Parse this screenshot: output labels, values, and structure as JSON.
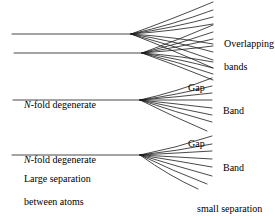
{
  "figure": {
    "type": "diagram"
  },
  "labels": {
    "overlapping_bands_line1": "Overlapping",
    "overlapping_bands_line2": "bands",
    "gap_upper": "Gap",
    "band_upper": "Band",
    "gap_lower": "Gap",
    "band_lower": "Band",
    "n_fold_upper_prefix": "N",
    "n_fold_upper_rest": "-fold degenerate",
    "n_fold_lower_prefix": "N",
    "n_fold_lower_rest": "-fold degenerate",
    "large_separation_line1": "Large separation",
    "large_separation_line2": "between atoms",
    "small_separation_line1": "small separation",
    "small_separation_line2": "between atoms"
  },
  "colors": {
    "stroke": "#1a1a1a",
    "background": "#ffffff",
    "text": "#000000"
  },
  "diagram_data": {
    "levels": [
      {
        "id": "level-1",
        "name": "top-level",
        "line_y": 34,
        "line_x_start": 12,
        "vertex_x": 131,
        "rays": 8,
        "spread_top": -32,
        "spread_bottom": 34,
        "right_x": 213
      },
      {
        "id": "level-2",
        "name": "second-level",
        "line_y": 53,
        "line_x_start": 14,
        "vertex_x": 142,
        "rays": 8,
        "spread_top": -28,
        "spread_bottom": 27,
        "right_x": 213
      },
      {
        "id": "level-3",
        "name": "third-level",
        "line_y": 100,
        "line_x_start": 13,
        "vertex_x": 140,
        "rays": 8,
        "spread_top": -22,
        "spread_bottom": 24,
        "right_x": 212
      },
      {
        "id": "level-4",
        "name": "bottom-level",
        "line_y": 155,
        "line_x_start": 12,
        "vertex_x": 140,
        "rays": 8,
        "spread_top": -20,
        "spread_bottom": 32,
        "right_x": 212
      }
    ]
  }
}
